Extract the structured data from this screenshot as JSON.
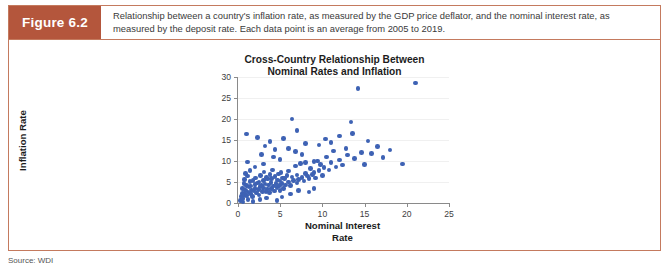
{
  "figure": {
    "label": "Figure 6.2",
    "caption": "Relationship between a country's inflation rate, as measured by the GDP price deflator, and the nominal interest rate, as measured by the deposit rate. Each data point is an average from 2005 to 2019.",
    "source": "Source: WDI",
    "accent_color": "#b4563c",
    "border_color": "#c47a5e"
  },
  "chart_data": {
    "type": "scatter",
    "title": "Cross-Country Relationship Between Nominal Rates and Inflation",
    "title_line1": "Cross-Country Relationship Between",
    "title_line2": "Nominal Rates and Inflation",
    "xlabel": "Nominal Interest Rate",
    "xlabel_line1": "Nominal Interest",
    "xlabel_line2": "Rate",
    "ylabel": "Inflation Rate",
    "xlim": [
      0,
      25
    ],
    "ylim": [
      0,
      30
    ],
    "xticks": [
      0,
      5,
      10,
      15,
      20,
      25
    ],
    "yticks": [
      0,
      5,
      10,
      15,
      20,
      25,
      30
    ],
    "grid": true,
    "legend": null,
    "marker_color": "#3e62b4",
    "points": [
      [
        0.3,
        0.6
      ],
      [
        0.4,
        1.5
      ],
      [
        0.5,
        2.3
      ],
      [
        0.5,
        3.4
      ],
      [
        0.6,
        1.1
      ],
      [
        0.7,
        4.6
      ],
      [
        0.8,
        2.0
      ],
      [
        0.8,
        5.6
      ],
      [
        0.9,
        3.0
      ],
      [
        1.0,
        1.8
      ],
      [
        1.0,
        4.2
      ],
      [
        1.1,
        6.4
      ],
      [
        1.2,
        2.6
      ],
      [
        1.2,
        0.9
      ],
      [
        1.3,
        3.8
      ],
      [
        1.4,
        5.1
      ],
      [
        1.5,
        2.2
      ],
      [
        1.5,
        4.0
      ],
      [
        1.6,
        3.1
      ],
      [
        1.7,
        1.6
      ],
      [
        1.8,
        5.4
      ],
      [
        1.9,
        2.9
      ],
      [
        2.0,
        4.4
      ],
      [
        2.0,
        3.5
      ],
      [
        2.1,
        6.0
      ],
      [
        2.2,
        2.4
      ],
      [
        2.3,
        4.8
      ],
      [
        2.4,
        3.2
      ],
      [
        2.5,
        5.0
      ],
      [
        2.5,
        1.9
      ],
      [
        2.6,
        3.9
      ],
      [
        2.7,
        6.6
      ],
      [
        2.8,
        4.1
      ],
      [
        2.9,
        2.7
      ],
      [
        3.0,
        5.3
      ],
      [
        3.0,
        3.6
      ],
      [
        3.1,
        7.4
      ],
      [
        3.2,
        4.5
      ],
      [
        3.3,
        2.8
      ],
      [
        3.4,
        6.1
      ],
      [
        3.5,
        3.3
      ],
      [
        3.5,
        5.7
      ],
      [
        3.6,
        4.3
      ],
      [
        3.7,
        2.5
      ],
      [
        3.8,
        6.8
      ],
      [
        3.9,
        4.9
      ],
      [
        4.0,
        3.4
      ],
      [
        4.0,
        5.9
      ],
      [
        4.1,
        7.9
      ],
      [
        4.2,
        4.0
      ],
      [
        4.3,
        2.9
      ],
      [
        4.4,
        6.3
      ],
      [
        4.5,
        4.7
      ],
      [
        4.6,
        3.7
      ],
      [
        4.7,
        5.5
      ],
      [
        4.8,
        6.9
      ],
      [
        4.9,
        4.2
      ],
      [
        5.0,
        3.0
      ],
      [
        5.0,
        5.2
      ],
      [
        5.1,
        7.2
      ],
      [
        5.2,
        4.6
      ],
      [
        5.3,
        6.0
      ],
      [
        5.4,
        3.5
      ],
      [
        5.5,
        5.8
      ],
      [
        5.6,
        4.3
      ],
      [
        5.8,
        6.5
      ],
      [
        6.0,
        5.0
      ],
      [
        6.0,
        7.6
      ],
      [
        6.2,
        4.1
      ],
      [
        6.4,
        6.2
      ],
      [
        6.6,
        5.4
      ],
      [
        6.8,
        8.8
      ],
      [
        7.0,
        4.8
      ],
      [
        7.0,
        6.7
      ],
      [
        7.2,
        5.6
      ],
      [
        7.4,
        9.4
      ],
      [
        7.6,
        6.1
      ],
      [
        7.8,
        5.2
      ],
      [
        8.0,
        7.0
      ],
      [
        8.0,
        9.7
      ],
      [
        8.2,
        6.4
      ],
      [
        8.4,
        5.9
      ],
      [
        8.6,
        8.2
      ],
      [
        8.8,
        6.8
      ],
      [
        9.0,
        9.9
      ],
      [
        9.0,
        7.3
      ],
      [
        9.2,
        6.0
      ],
      [
        9.4,
        10.0
      ],
      [
        9.6,
        7.7
      ],
      [
        9.8,
        9.2
      ],
      [
        10.0,
        6.5
      ],
      [
        10.2,
        8.4
      ],
      [
        10.5,
        11.0
      ],
      [
        10.8,
        7.9
      ],
      [
        11.0,
        9.6
      ],
      [
        11.3,
        12.4
      ],
      [
        11.6,
        8.6
      ],
      [
        12.0,
        10.2
      ],
      [
        12.4,
        9.0
      ],
      [
        12.8,
        13.0
      ],
      [
        13.0,
        11.4
      ],
      [
        13.4,
        19.3
      ],
      [
        13.8,
        10.6
      ],
      [
        14.2,
        27.2
      ],
      [
        14.6,
        12.0
      ],
      [
        15.0,
        9.1
      ],
      [
        15.4,
        14.8
      ],
      [
        15.8,
        11.8
      ],
      [
        16.5,
        13.4
      ],
      [
        17.2,
        10.8
      ],
      [
        18.0,
        12.6
      ],
      [
        19.5,
        9.3
      ],
      [
        21.0,
        28.6
      ],
      [
        1.0,
        16.4
      ],
      [
        2.3,
        15.6
      ],
      [
        3.8,
        14.6
      ],
      [
        5.4,
        15.4
      ],
      [
        6.0,
        13.0
      ],
      [
        6.8,
        12.2
      ],
      [
        7.6,
        11.6
      ],
      [
        4.2,
        11.0
      ],
      [
        5.0,
        10.4
      ],
      [
        2.0,
        8.6
      ],
      [
        1.4,
        7.8
      ],
      [
        0.9,
        7.0
      ],
      [
        3.0,
        9.3
      ],
      [
        6.4,
        20.0
      ],
      [
        7.0,
        17.3
      ],
      [
        1.8,
        0.4
      ],
      [
        2.6,
        0.8
      ],
      [
        3.4,
        1.2
      ],
      [
        4.6,
        0.6
      ],
      [
        0.6,
        0.2
      ],
      [
        5.2,
        1.4
      ],
      [
        6.2,
        2.1
      ],
      [
        7.2,
        3.0
      ],
      [
        8.4,
        2.6
      ],
      [
        9.0,
        3.4
      ],
      [
        1.1,
        9.8
      ],
      [
        2.8,
        11.6
      ],
      [
        4.4,
        12.8
      ],
      [
        3.2,
        13.6
      ],
      [
        8.0,
        14.2
      ],
      [
        9.6,
        13.8
      ],
      [
        10.4,
        15.2
      ],
      [
        12.0,
        16.0
      ],
      [
        13.6,
        16.6
      ],
      [
        11.0,
        14.4
      ]
    ]
  }
}
